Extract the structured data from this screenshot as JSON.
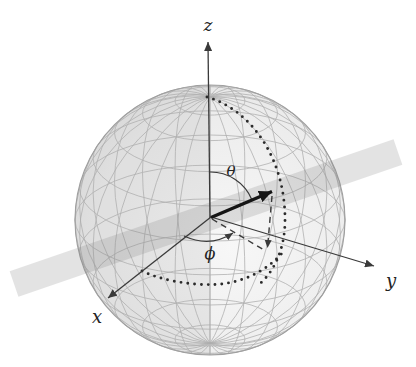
{
  "figure": {
    "type": "spherical-coordinates-sphere-diagram",
    "axis_labels": {
      "z": "z",
      "y": "y",
      "x": "x"
    },
    "angle_labels": {
      "theta": "θ",
      "phi": "ϕ"
    },
    "colors": {
      "background": "#ffffff",
      "mesh": "#aeaeae",
      "sphere_fill_light": "#f7f7f7",
      "sphere_fill_dark": "#dcdcdc",
      "outline": "#9f9f9f",
      "band": "rgba(128,128,128,0.22)",
      "axis": "#3a3a3a",
      "vector": "#151515",
      "dotted": "#2b2b2b",
      "dashed": "#3a3a3a",
      "label": "#232323"
    },
    "sphere": {
      "cx": 210,
      "cy": 220,
      "r": 135,
      "tilt_deg": 24,
      "meridian_step_deg": 15,
      "latitude_step_deg": 15,
      "mesh_width": 0.9,
      "mesh_opacity": 0.85
    },
    "band": {
      "cx": 206,
      "cy": 218,
      "length": 406,
      "width": 27,
      "angle_deg": -19
    }
  }
}
